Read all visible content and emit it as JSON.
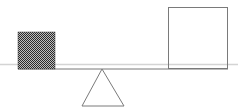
{
  "diagram": {
    "type": "seesaw-balance",
    "colors": {
      "beam_light": "#d4d4d4",
      "beam_dark": "#777777",
      "outline": "#7a7a7a",
      "checker_dark": "#2a2a2a",
      "checker_light": "#bdbdbd"
    },
    "left_object": {
      "shape": "square",
      "fill": "checkered-dense",
      "x": 18,
      "y": 32,
      "size": 37
    },
    "right_object": {
      "shape": "square",
      "fill": "empty",
      "x": 168,
      "y": 7,
      "size": 60
    },
    "fulcrum": {
      "shape": "triangle",
      "apex": [
        102,
        69
      ],
      "base_left": [
        82,
        106
      ],
      "base_right": [
        124,
        106
      ]
    }
  }
}
